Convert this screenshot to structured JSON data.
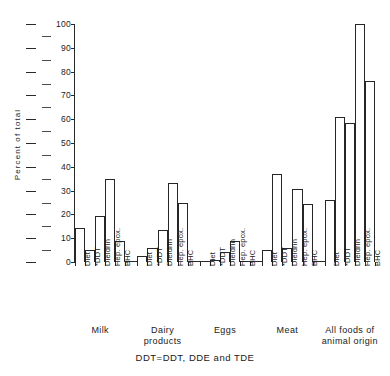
{
  "chart_data": {
    "type": "bar",
    "title": "",
    "xlabel": "",
    "ylabel": "Percent of total",
    "ylim": [
      0,
      100
    ],
    "yticks": [
      0,
      10,
      20,
      30,
      40,
      50,
      60,
      70,
      80,
      90,
      100
    ],
    "minor_tick_step": 5,
    "grid": false,
    "legend": null,
    "footnote": "DDT=DDT, DDE and TDE",
    "categories": [
      "Diet",
      "*DDT",
      "Dieldrin",
      "Hep. epox.",
      "BHC"
    ],
    "groups": [
      {
        "name": "Milk",
        "values": [
          14.5,
          5,
          19.5,
          35,
          9
        ]
      },
      {
        "name": "Dairy\nproducts",
        "values": [
          2.5,
          6,
          13.5,
          33,
          25
        ]
      },
      {
        "name": "Eggs",
        "values": [
          0,
          1,
          4,
          9,
          0
        ]
      },
      {
        "name": "Meat",
        "values": [
          5,
          37,
          6,
          30.5,
          24.5
        ]
      },
      {
        "name": "All foods of\nanimal origin",
        "values": [
          26,
          61,
          58.5,
          100,
          76
        ]
      }
    ]
  }
}
